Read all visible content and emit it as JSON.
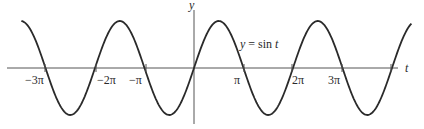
{
  "chart_data": {
    "type": "line",
    "title": "",
    "function_label": "y = sin t",
    "xlabel": "t",
    "ylabel": "y",
    "x_ticks": [
      "−3π",
      "−2π",
      "−π",
      "π",
      "2π",
      "3π"
    ],
    "x_tick_values": [
      -9.4248,
      -6.2832,
      -3.1416,
      3.1416,
      6.2832,
      9.4248
    ],
    "x_range": [
      -10.96,
      13.8
    ],
    "y_range": [
      -1,
      1
    ],
    "series": [
      {
        "name": "y = sin t",
        "function": "sin",
        "t_start": -10.96,
        "t_end": 13.8
      }
    ],
    "grid": false,
    "colors": {
      "curve": "#2a2a2a",
      "axes": "#555555"
    }
  },
  "labels": {
    "y_axis": "y",
    "t_axis": "t",
    "equation": "y = sin  t",
    "ticks": {
      "neg3pi": "−3π",
      "neg2pi": "−2π",
      "negpi": "−π",
      "pi": "π",
      "twopi": "2π",
      "threepi": "3π"
    }
  }
}
